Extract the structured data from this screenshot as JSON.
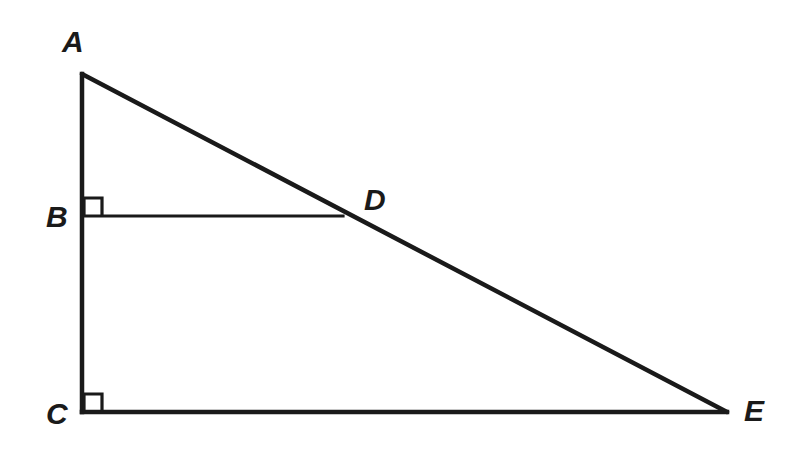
{
  "figure": {
    "background_color": "#ffffff",
    "stroke_color": "#1a1a1a",
    "canvas": {
      "width": 796,
      "height": 452
    }
  },
  "points": {
    "A": {
      "label": "A",
      "x": 82,
      "y": 74,
      "label_x": 62,
      "label_y": 52
    },
    "B": {
      "label": "B",
      "x": 82,
      "y": 216,
      "label_x": 46,
      "label_y": 227
    },
    "C": {
      "label": "C",
      "x": 82,
      "y": 412,
      "label_x": 46,
      "label_y": 424
    },
    "D": {
      "label": "D",
      "x": 341,
      "y": 216,
      "label_x": 364,
      "label_y": 210
    },
    "E": {
      "label": "E",
      "x": 725,
      "y": 412,
      "label_x": 744,
      "label_y": 421
    }
  },
  "segments": [
    {
      "name": "segment-AC",
      "from": "A",
      "to": "C",
      "width": 4.5
    },
    {
      "name": "segment-AE",
      "from": "A",
      "to": "E",
      "width": 4.5
    },
    {
      "name": "segment-CE",
      "from": "C",
      "to": "E",
      "width": 4.5
    },
    {
      "name": "segment-BD",
      "from": "B",
      "to": "D",
      "width": 3.2
    }
  ],
  "right_angles": [
    {
      "name": "right-angle-marker-B",
      "at": "B",
      "size": 18,
      "dir_x": 1,
      "dir_y": -1
    },
    {
      "name": "right-angle-marker-C",
      "at": "C",
      "size": 18,
      "dir_x": 1,
      "dir_y": -1
    }
  ],
  "labels": {
    "A": "A",
    "B": "B",
    "C": "C",
    "D": "D",
    "E": "E"
  }
}
